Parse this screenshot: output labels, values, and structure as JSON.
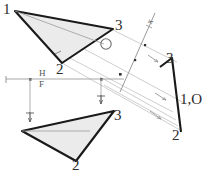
{
  "figure": {
    "background_color": "#ffffff",
    "stroke_color": "#1a1a1a",
    "projection_line_color": "#b8b8b8",
    "fill_color": "#ebebeb",
    "label_color": "#3a3a3a"
  },
  "fold_lines": {
    "hf": {
      "upper_label": "H",
      "lower_label": "F"
    },
    "auxiliary": {
      "label": "x",
      "tick_label": "1"
    }
  },
  "views": {
    "top": {
      "name": "horizontal-view",
      "vertices": [
        {
          "label": "1",
          "x": 14,
          "y": 10
        },
        {
          "label": "2",
          "x": 62,
          "y": 65
        },
        {
          "label": "3",
          "x": 113,
          "y": 27
        }
      ]
    },
    "front": {
      "name": "frontal-view",
      "vertices": [
        {
          "label": "2",
          "x": 78,
          "y": 164
        },
        {
          "label": "3",
          "x": 116,
          "y": 118
        }
      ]
    },
    "auxiliary": {
      "name": "auxiliary-edge-view",
      "vertices": [
        {
          "label": "3",
          "x": 172,
          "y": 58
        },
        {
          "label": "1,O",
          "x": 181,
          "y": 100
        },
        {
          "label": "2",
          "x": 176,
          "y": 135
        }
      ]
    }
  },
  "annotations": {
    "point_o_top": "O"
  }
}
